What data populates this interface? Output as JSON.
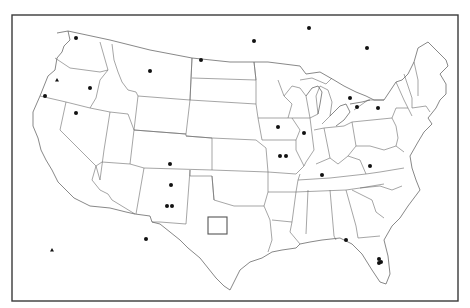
{
  "map": {
    "title": "",
    "region": "Contiguous United States",
    "frame": {
      "x": 12,
      "y": 15,
      "width": 446,
      "height": 286
    },
    "colors": {
      "background": "#ffffff",
      "border": "#3a3a3a",
      "state_lines": "#6a6a6a",
      "markers": "#111111"
    },
    "markers": {
      "dots": [
        {
          "x": 76,
          "y": 38
        },
        {
          "x": 90,
          "y": 88
        },
        {
          "x": 45,
          "y": 96
        },
        {
          "x": 76,
          "y": 113
        },
        {
          "x": 150,
          "y": 71
        },
        {
          "x": 201,
          "y": 60
        },
        {
          "x": 254,
          "y": 41
        },
        {
          "x": 309,
          "y": 28
        },
        {
          "x": 367,
          "y": 48
        },
        {
          "x": 278,
          "y": 127
        },
        {
          "x": 304,
          "y": 133
        },
        {
          "x": 280,
          "y": 156
        },
        {
          "x": 286,
          "y": 156
        },
        {
          "x": 350,
          "y": 98
        },
        {
          "x": 378,
          "y": 108
        },
        {
          "x": 370,
          "y": 166
        },
        {
          "x": 357,
          "y": 107
        },
        {
          "x": 322,
          "y": 175
        },
        {
          "x": 170,
          "y": 164
        },
        {
          "x": 171,
          "y": 185
        },
        {
          "x": 167,
          "y": 206
        },
        {
          "x": 172,
          "y": 206
        },
        {
          "x": 146,
          "y": 239
        },
        {
          "x": 346,
          "y": 240
        },
        {
          "x": 379,
          "y": 259
        },
        {
          "x": 381,
          "y": 262
        },
        {
          "x": 379,
          "y": 263
        }
      ],
      "triangles": [
        {
          "x": 57,
          "y": 80
        },
        {
          "x": 52,
          "y": 250
        }
      ],
      "boxes": [
        {
          "x": 208,
          "y": 217,
          "width": 19,
          "height": 17
        }
      ]
    }
  }
}
